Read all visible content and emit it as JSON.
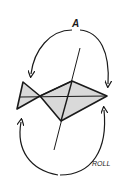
{
  "diagram": {
    "type": "roll-axis-illustration",
    "labels": {
      "top": "A",
      "bottom_right": "ROLL"
    },
    "colors": {
      "ink": "#1a1a1a",
      "fill": "#d9d9d9",
      "background": "#ffffff"
    }
  }
}
